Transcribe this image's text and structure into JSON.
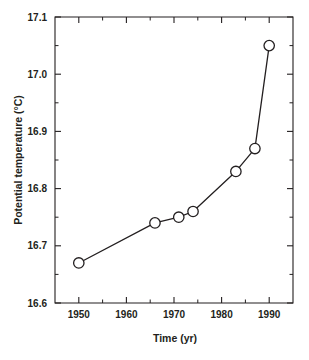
{
  "chart_data": {
    "type": "line",
    "title": "",
    "xlabel": "Time (yr)",
    "ylabel": "Potential temperature (°C)",
    "xlim": [
      1945,
      1995
    ],
    "ylim": [
      16.6,
      17.1
    ],
    "grid": false,
    "legend": null,
    "x_major_ticks": [
      1950,
      1960,
      1970,
      1980,
      1990
    ],
    "x_major_tick_labels": [
      "1950",
      "1960",
      "1970",
      "1980",
      "1990"
    ],
    "x_minor_ticks": [
      1945,
      1955,
      1965,
      1975,
      1985,
      1995
    ],
    "y_major_ticks": [
      16.6,
      16.7,
      16.8,
      16.9,
      17.0,
      17.1
    ],
    "y_major_tick_labels": [
      "16.6",
      "16.7",
      "16.8",
      "16.9",
      "17.0",
      "17.1"
    ],
    "y_minor_ticks": [
      16.65,
      16.75,
      16.85,
      16.95,
      17.05
    ],
    "marker": "open-circle",
    "series": [
      {
        "name": "Potential temperature",
        "x": [
          1950,
          1966,
          1971,
          1974,
          1983,
          1987,
          1990
        ],
        "values": [
          16.67,
          16.74,
          16.75,
          16.76,
          16.83,
          16.87,
          17.05
        ]
      }
    ]
  }
}
